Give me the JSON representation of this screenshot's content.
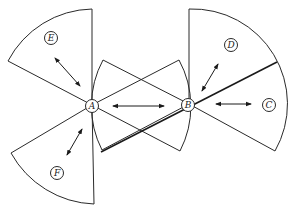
{
  "diagram": {
    "title": "",
    "nodes": [
      {
        "id": "A",
        "label": "A"
      },
      {
        "id": "B",
        "label": "B"
      },
      {
        "id": "C",
        "label": "C"
      },
      {
        "id": "D",
        "label": "D"
      },
      {
        "id": "E",
        "label": "E"
      },
      {
        "id": "F",
        "label": "F"
      }
    ],
    "edges": [
      {
        "from": "A",
        "to": "E",
        "type": "bidirectional"
      },
      {
        "from": "A",
        "to": "F",
        "type": "bidirectional"
      },
      {
        "from": "A",
        "to": "B",
        "type": "bidirectional"
      },
      {
        "from": "B",
        "to": "D",
        "type": "bidirectional"
      },
      {
        "from": "B",
        "to": "C",
        "type": "bidirectional"
      }
    ],
    "regions": [
      {
        "name": "sector-E",
        "origin": "A"
      },
      {
        "name": "sector-F",
        "origin": "A"
      },
      {
        "name": "wedge-A-to-B",
        "origin": "A"
      },
      {
        "name": "wedge-B-to-A",
        "origin": "B"
      },
      {
        "name": "sector-D",
        "origin": "B"
      },
      {
        "name": "sector-C",
        "origin": "B"
      }
    ],
    "colors": {
      "line": "#2a2a2a",
      "background": "#ffffff"
    }
  }
}
